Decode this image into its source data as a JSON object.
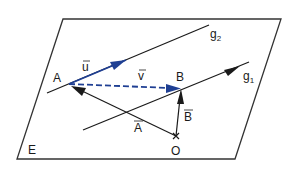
{
  "diagram": {
    "plane_label": "E",
    "lines": [
      {
        "id": "g1",
        "label": "g",
        "subscript": "1"
      },
      {
        "id": "g2",
        "label": "g",
        "subscript": "2"
      }
    ],
    "points": {
      "A": "A",
      "B": "B",
      "O": "O"
    },
    "vectors": {
      "u": "u",
      "v": "v",
      "A_vec": "A",
      "B_vec": "B"
    },
    "colors": {
      "blue": "#1f3f93",
      "black": "#1a1a1a",
      "frame": "#333333"
    }
  }
}
